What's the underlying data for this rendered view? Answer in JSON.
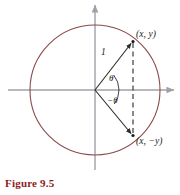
{
  "figure": {
    "caption": "Figure 9.5",
    "caption_color": "#8c1b1b",
    "background": "#ffffff",
    "width": 180,
    "height": 195
  },
  "diagram": {
    "type": "unit-circle-geometry",
    "circle": {
      "center_x": 95,
      "center_y": 90,
      "radius": 65,
      "stroke_color": "#8a4a4a"
    },
    "axes": {
      "stroke_color": "#a0a0a8",
      "x_axis_y": 90,
      "y_axis_x": 95,
      "x_axis_start": 8,
      "x_axis_end": 176,
      "y_axis_start": 3,
      "y_axis_end": 170,
      "arrow_right": true,
      "arrow_up": true
    },
    "radii": {
      "stroke_color": "#2b2b2b",
      "upper_end_x": 133,
      "upper_end_y": 41,
      "lower_end_x": 133,
      "lower_end_y": 136
    },
    "chord": {
      "style": "dashed",
      "stroke_color": "#3a3a3a",
      "x": 133,
      "y_top": 41,
      "y_bottom": 136
    },
    "angle_arcs": {
      "stroke_color": "#2b2b2b",
      "upper_label": "θ",
      "lower_label": "−θ"
    }
  },
  "labels": {
    "point_upper": "(x, y)",
    "point_lower": "(x, −y)",
    "radius": "1",
    "theta_positive": "θ",
    "theta_negative": "−θ"
  }
}
